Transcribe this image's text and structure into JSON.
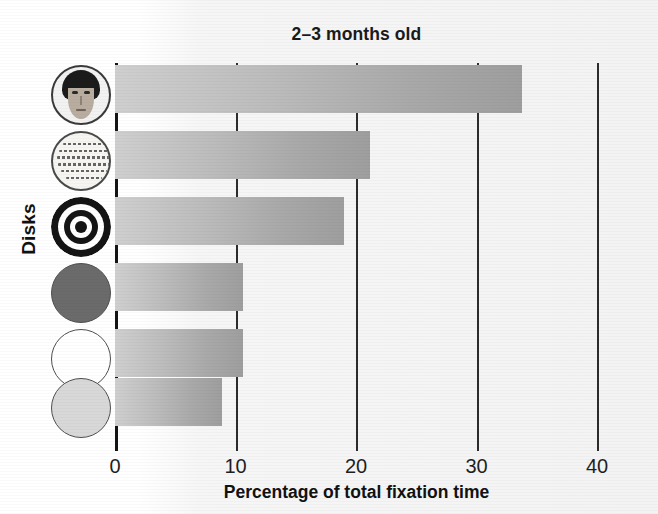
{
  "chart_data": {
    "type": "bar",
    "orientation": "horizontal",
    "title": "2–3 months old",
    "xlabel": "Percentage of total fixation time",
    "ylabel": "Disks",
    "xlim": [
      0,
      40
    ],
    "xticks": [
      "0",
      "10",
      "20",
      "30",
      "40"
    ],
    "xtick_values": [
      0,
      10,
      20,
      30,
      40
    ],
    "grid": true,
    "legend": "none",
    "categories": [
      "face disk",
      "printed matter disk",
      "bull's-eye disk",
      "red disk",
      "white disk",
      "yellow disk"
    ],
    "values": [
      33.8,
      21.2,
      19.0,
      10.6,
      10.6,
      8.9
    ],
    "series": [
      {
        "name": "Percentage of total fixation time",
        "values": [
          33.8,
          21.2,
          19.0,
          10.6,
          10.6,
          8.9
        ]
      }
    ],
    "bar_color": "#b5b5b5",
    "axis_color": "#2c2c2c"
  },
  "title": {
    "text": "2–3 months old"
  },
  "axes": {
    "y_label": "Disks",
    "x_label": "Percentage of total fixation time",
    "x_ticks": [
      {
        "label": "0",
        "value": 0
      },
      {
        "label": "10",
        "value": 10
      },
      {
        "label": "20",
        "value": 20
      },
      {
        "label": "30",
        "value": 30
      },
      {
        "label": "40",
        "value": 40
      }
    ]
  },
  "bars": [
    {
      "category": "face disk",
      "icon": "face-disk-icon",
      "value": 33.8
    },
    {
      "category": "printed matter disk",
      "icon": "print-disk-icon",
      "value": 21.2
    },
    {
      "category": "bull's-eye disk",
      "icon": "bullseye-disk-icon",
      "value": 19.0
    },
    {
      "category": "red disk",
      "icon": "red-disk-icon",
      "value": 10.6
    },
    {
      "category": "white disk",
      "icon": "white-disk-icon",
      "value": 10.6
    },
    {
      "category": "yellow disk",
      "icon": "yellow-disk-icon",
      "value": 8.9
    }
  ],
  "colors": {
    "red_disk": "#6b6b6b",
    "white_disk": "#ffffff",
    "yellow_disk": "#d8d8d8",
    "bar_light": "#cfcfcf",
    "bar_dark": "#9e9e9e",
    "axis": "#2c2c2c",
    "text": "#141414"
  }
}
